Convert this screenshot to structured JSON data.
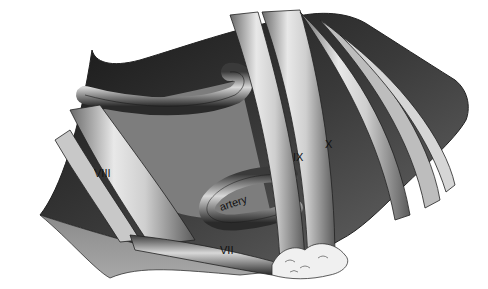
{
  "diagram": {
    "type": "anatomical-illustration",
    "labels": {
      "nerve_8": "VIII",
      "nerve_7": "VII",
      "nerve_9": "IX",
      "nerve_10": "X",
      "artery": "artery"
    }
  }
}
